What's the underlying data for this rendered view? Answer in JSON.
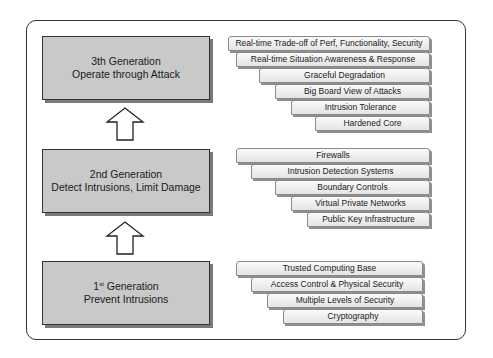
{
  "diagram": {
    "generations": [
      {
        "title": "3th Generation",
        "subtitle": "Operate through Attack"
      },
      {
        "title": "2nd Generation",
        "subtitle": "Detect Intrusions, Limit Damage"
      },
      {
        "title_num": "1",
        "title_sup": "st",
        "title_rest": " Generation",
        "subtitle": "Prevent Intrusions"
      }
    ],
    "third_gen_items": [
      "Real-time Trade-off of Perf, Functionality, Security",
      "Real-time Situation Awareness & Response",
      "Graceful Degradation",
      "Big Board View of Attacks",
      "Intrusion Tolerance",
      "Hardened Core"
    ],
    "second_gen_items": [
      "Firewalls",
      "Intrusion Detection Systems",
      "Boundary Controls",
      "Virtual Private Networks",
      "Public Key Infrastructure"
    ],
    "first_gen_items": [
      "Trusted Computing Base",
      "Access Control & Physical Security",
      "Multiple Levels of Security",
      "Cryptography"
    ],
    "colors": {
      "box_fill": "#c9c9c9",
      "border": "#333333",
      "tab_fill": "#eeeeee"
    }
  }
}
